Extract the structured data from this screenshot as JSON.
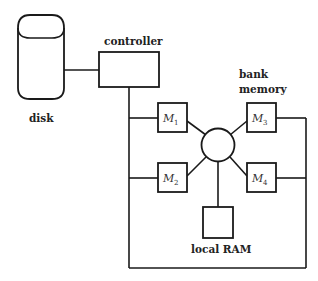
{
  "diagram": {
    "labels": {
      "disk": "disk",
      "controller": "controller",
      "bank_line1": "bank",
      "bank_line2": "memory",
      "local_ram": "local RAM"
    },
    "modules": [
      {
        "name": "M",
        "sub": "1"
      },
      {
        "name": "M",
        "sub": "2"
      },
      {
        "name": "M",
        "sub": "3"
      },
      {
        "name": "M",
        "sub": "4"
      }
    ],
    "colors": {
      "stroke": "#1a1a1a",
      "background": "#ffffff"
    }
  }
}
